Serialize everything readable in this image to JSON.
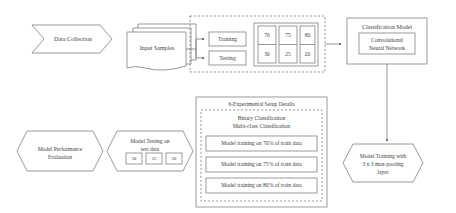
{
  "diagram": {
    "stroke_color": "#6f6f6f",
    "text_color": "#3d3d3d",
    "background": "#ffffff"
  },
  "nodes": {
    "data_collection": {
      "label": "Data Collection",
      "shape": "chevron"
    },
    "input_samples": {
      "label": "Input Samples",
      "shape": "stacked-documents"
    },
    "training": {
      "label": "Training",
      "shape": "box"
    },
    "testing": {
      "label": "Testing",
      "shape": "box"
    },
    "classification_model": {
      "label": "Classification Model",
      "inner_label": "Convolutional\nNeural Network",
      "inner_line1": "Convolutional",
      "inner_line2": "Neural Network"
    },
    "model_training": {
      "line1": "Model Training with",
      "line2": "3 x 3 max-pooling",
      "line3": "layer",
      "shape": "chevron"
    },
    "model_testing": {
      "line1": "Model Testing on",
      "line2": "test data",
      "shape": "chevron",
      "values": [
        "30",
        "25",
        "20"
      ]
    },
    "model_performance": {
      "line1": "Model Performance",
      "line2": "Evaluation",
      "shape": "chevron"
    }
  },
  "split_table": {
    "columns": [
      {
        "train": "70",
        "test": "30"
      },
      {
        "train": "75",
        "test": "25"
      },
      {
        "train": "80",
        "test": "20"
      }
    ]
  },
  "experimental_setup": {
    "title": "6-Experimental Setup Details",
    "subtitle_line1": "Binary Classification",
    "subtitle_line2": "Multi-class Classification",
    "rows": [
      "Model training on 70% of train data",
      "Model training on 75% of train data",
      "Model training on 80% of train data"
    ]
  }
}
